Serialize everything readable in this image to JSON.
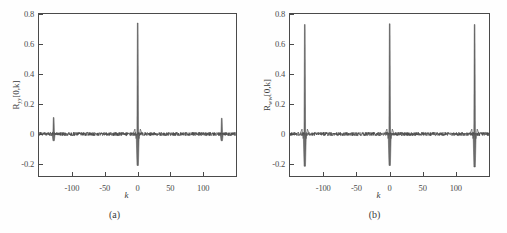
{
  "figure": {
    "background": "#ffffff",
    "line_color": "#4a4a4a",
    "axis_color": "#4a4a4a"
  },
  "panels": [
    {
      "id": "a",
      "caption": "(a)",
      "ylabel_main": "R",
      "ylabel_sub": "yy",
      "ylabel_tail": "[0,k]",
      "xlabel": "k",
      "yticks": [
        "0.8",
        "0.6",
        "0.4",
        "0.2",
        "0",
        "-0.2"
      ],
      "ytick_values": [
        0.8,
        0.6,
        0.4,
        0.2,
        0,
        -0.2
      ],
      "xticks": [
        "-100",
        "-50",
        "0",
        "50",
        "100"
      ],
      "xtick_values": [
        -100,
        -50,
        0,
        50,
        100
      ]
    },
    {
      "id": "b",
      "caption": "(b)",
      "ylabel_main": "R",
      "ylabel_sub": "ww",
      "ylabel_tail": "[0,k]",
      "xlabel": "k",
      "yticks": [
        "0.8",
        "0.6",
        "0.4",
        "0.2",
        "0",
        "-0.2"
      ],
      "ytick_values": [
        0.8,
        0.6,
        0.4,
        0.2,
        0,
        -0.2
      ],
      "xticks": [
        "-100",
        "-50",
        "0",
        "50",
        "100"
      ],
      "xtick_values": [
        -100,
        -50,
        0,
        50,
        100
      ]
    }
  ],
  "chart_data": [
    {
      "type": "line",
      "panel": "a",
      "title": "",
      "xlabel": "k",
      "ylabel": "R_yy[0,k]",
      "xlim": [
        -150,
        150
      ],
      "ylim": [
        -0.28,
        0.8
      ],
      "grid": false,
      "legend": "none",
      "xticks": [
        -100,
        -50,
        0,
        50,
        100
      ],
      "yticks": [
        -0.2,
        0,
        0.2,
        0.4,
        0.6,
        0.8
      ],
      "description": "Autocorrelation of y: large central peak at k=0 reaching 0.74 with negative undershoot to -0.21; small side peaks at k=-128 and k=+128 reaching about 0.11 with undershoot to -0.04; low-amplitude noise floor near 0 elsewhere.",
      "peaks": [
        {
          "k": -128,
          "positive": 0.11,
          "negative": -0.045
        },
        {
          "k": 0,
          "positive": 0.74,
          "negative": -0.21
        },
        {
          "k": 128,
          "positive": 0.105,
          "negative": -0.045
        }
      ],
      "noise_floor_amplitude": 0.012
    },
    {
      "type": "line",
      "panel": "b",
      "title": "",
      "xlabel": "k",
      "ylabel": "R_ww[0,k]",
      "xlim": [
        -150,
        150
      ],
      "ylim": [
        -0.28,
        0.8
      ],
      "grid": false,
      "legend": "none",
      "xticks": [
        -100,
        -50,
        0,
        50,
        100
      ],
      "yticks": [
        -0.2,
        0,
        0.2,
        0.4,
        0.6,
        0.8
      ],
      "description": "Autocorrelation of w: three equal tall peaks at k=-128, k=0 and k=+128, each reaching about 0.73 with negative undershoot to about -0.21; low-amplitude noise floor near 0 elsewhere.",
      "peaks": [
        {
          "k": -128,
          "positive": 0.73,
          "negative": -0.215
        },
        {
          "k": 0,
          "positive": 0.735,
          "negative": -0.21
        },
        {
          "k": 128,
          "positive": 0.73,
          "negative": -0.22
        }
      ],
      "noise_floor_amplitude": 0.012
    }
  ]
}
